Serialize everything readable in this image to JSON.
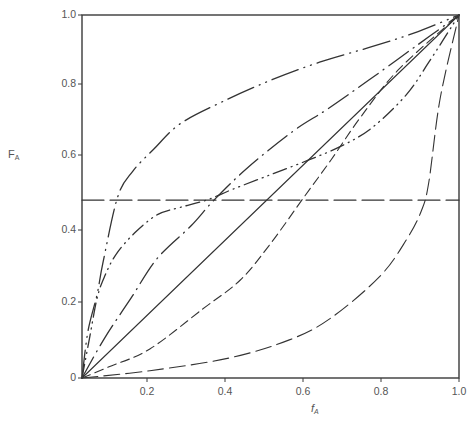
{
  "chart_data": {
    "type": "line",
    "title": "",
    "xlabel": "f",
    "xlabel_sub": "A",
    "ylabel": "F",
    "ylabel_sub": "A",
    "xlim": [
      0,
      1.0
    ],
    "ylim": [
      0,
      1.0
    ],
    "grid": false,
    "legend": "none",
    "x_ticks": [
      {
        "label": "0.2",
        "px": 147
      },
      {
        "label": "0.4",
        "px": 225
      },
      {
        "label": "0.6",
        "px": 303
      },
      {
        "label": "0.8",
        "px": 381
      },
      {
        "label": "1.0",
        "px": 459
      }
    ],
    "y_ticks": [
      {
        "label": "0",
        "py": 378
      },
      {
        "label": "0.2",
        "py": 302
      },
      {
        "label": "0.4",
        "py": 230
      },
      {
        "label": "0.6",
        "py": 155
      },
      {
        "label": "0.8",
        "py": 84
      },
      {
        "label": "1.0",
        "py": 15
      }
    ],
    "series": [
      {
        "name": "ideal (solid diagonal)",
        "style": "solid",
        "dash": "",
        "x": [
          0,
          1.0
        ],
        "y": [
          0,
          1.0
        ]
      },
      {
        "name": "alternating (horizontal long dash)",
        "style": "long-dash",
        "dash": "22 6",
        "x": [
          0,
          1.0
        ],
        "y": [
          0.49,
          0.49
        ]
      },
      {
        "name": "strongly enriched in A (dash-dot-dot, upper)",
        "style": "dash-dot-dot",
        "dash": "28 6 1 6 1 6",
        "x": [
          0,
          0.016,
          0.04,
          0.056,
          0.095,
          0.135,
          0.19,
          0.26,
          0.37,
          0.5,
          0.63,
          0.76,
          0.88,
          1.0
        ],
        "y": [
          0,
          0.13,
          0.23,
          0.32,
          0.5,
          0.57,
          0.63,
          0.7,
          0.76,
          0.82,
          0.87,
          0.91,
          0.95,
          1.0
        ]
      },
      {
        "name": "enriched in A (dash-dot)",
        "style": "dash-dot",
        "dash": "24 6 1 6",
        "x": [
          0,
          0.06,
          0.13,
          0.2,
          0.29,
          0.35,
          0.44,
          0.56,
          0.65,
          0.76,
          0.88,
          1.0
        ],
        "y": [
          0,
          0.11,
          0.22,
          0.33,
          0.42,
          0.49,
          0.58,
          0.68,
          0.74,
          0.82,
          0.91,
          1.0
        ]
      },
      {
        "name": "azeotropic (dash-dot-dot S-curve)",
        "style": "dash-dot-dot",
        "dash": "14 5 1 5 1 5",
        "x": [
          0,
          0.02,
          0.04,
          0.06,
          0.09,
          0.14,
          0.2,
          0.26,
          0.33,
          0.4,
          0.5,
          0.6,
          0.69,
          0.77,
          0.86,
          0.92,
          1.0
        ],
        "y": [
          0,
          0.11,
          0.22,
          0.28,
          0.34,
          0.4,
          0.45,
          0.47,
          0.49,
          0.52,
          0.56,
          0.6,
          0.64,
          0.69,
          0.78,
          0.87,
          1.0
        ]
      },
      {
        "name": "depleted in A (short dash)",
        "style": "short-dash",
        "dash": "9 5",
        "x": [
          0,
          0.07,
          0.18,
          0.32,
          0.42,
          0.5,
          0.59,
          0.66,
          0.74,
          0.84,
          1.0
        ],
        "y": [
          0,
          0.03,
          0.08,
          0.19,
          0.27,
          0.37,
          0.5,
          0.6,
          0.72,
          0.85,
          1.0
        ]
      },
      {
        "name": "strongly depleted in A (long dash, bottom)",
        "style": "long-dash",
        "dash": "16 6",
        "x": [
          0,
          0.18,
          0.39,
          0.55,
          0.66,
          0.79,
          0.86,
          0.9,
          0.92,
          0.95,
          1.0
        ],
        "y": [
          0,
          0.02,
          0.055,
          0.105,
          0.165,
          0.28,
          0.38,
          0.46,
          0.54,
          0.77,
          1.0
        ]
      }
    ]
  }
}
